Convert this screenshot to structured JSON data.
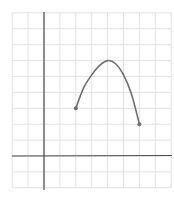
{
  "chart_data": {
    "type": "line",
    "title": "",
    "xlabel": "",
    "ylabel": "",
    "grid": true,
    "xlim": [
      -2,
      8
    ],
    "ylim": [
      -2,
      9
    ],
    "axes_origin": [
      0,
      0
    ],
    "series": [
      {
        "name": "curve",
        "points": [
          [
            2,
            3
          ],
          [
            2.5,
            4.3
          ],
          [
            3,
            5.1
          ],
          [
            3.5,
            5.7
          ],
          [
            4,
            6
          ],
          [
            4.5,
            5.8
          ],
          [
            5,
            5.1
          ],
          [
            5.5,
            3.9
          ],
          [
            6,
            2
          ]
        ],
        "endpoints": [
          [
            2,
            3
          ],
          [
            6,
            2
          ]
        ],
        "color": "#6e6e6e"
      }
    ],
    "colors": {
      "grid": "#e2e2e2",
      "axis": "#4a4a4a"
    }
  }
}
